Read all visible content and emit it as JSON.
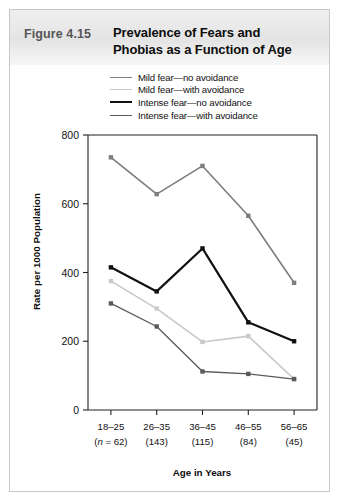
{
  "figure": {
    "number_label": "Figure 4.15",
    "title_line1": "Prevalence of Fears and",
    "title_line2": "Phobias as a Function of Age"
  },
  "legend": {
    "position": "top",
    "items": [
      {
        "label": "Mild fear—no avoidance",
        "color": "#7d7d7d",
        "width": 1.6
      },
      {
        "label": "Mild fear—with avoidance",
        "color": "#c9c9c9",
        "width": 1.6
      },
      {
        "label": "Intense fear—no avoidance",
        "color": "#111111",
        "width": 2.2
      },
      {
        "label": "Intense fear—with avoidance",
        "color": "#5a5a5a",
        "width": 1.3
      }
    ]
  },
  "axes": {
    "ylabel": "Rate per 1000 Population",
    "xlabel": "Age in Years",
    "yticks": [
      "800",
      "600",
      "400",
      "200",
      "0"
    ],
    "ylim_min": 0,
    "ylim_max": 800,
    "grid": false,
    "xtick_labels": [
      "18–25",
      "26–35",
      "36–45",
      "46–55",
      "56–65"
    ],
    "xtick_sublabels": [
      "(n = 62)",
      "(143)",
      "(115)",
      "(84)",
      "(45)"
    ],
    "xtick_sub_italic_first": "n"
  },
  "chart_data": {
    "type": "line",
    "title": "Prevalence of Fears and Phobias as a Function of Age",
    "xlabel": "Age in Years",
    "ylabel": "Rate per 1000 Population",
    "ylim": [
      0,
      800
    ],
    "grid": false,
    "legend_position": "top",
    "categories": [
      "18–25",
      "26–35",
      "36–45",
      "46–55",
      "56–65"
    ],
    "sample_sizes": [
      62,
      143,
      115,
      84,
      45
    ],
    "series": [
      {
        "name": "Mild fear—no avoidance",
        "color": "#7d7d7d",
        "values": [
          735,
          628,
          710,
          565,
          370
        ]
      },
      {
        "name": "Mild fear—with avoidance",
        "color": "#c9c9c9",
        "values": [
          375,
          295,
          198,
          215,
          90
        ]
      },
      {
        "name": "Intense fear—no avoidance",
        "color": "#111111",
        "values": [
          415,
          345,
          470,
          255,
          200
        ]
      },
      {
        "name": "Intense fear—with avoidance",
        "color": "#5a5a5a",
        "values": [
          310,
          243,
          112,
          105,
          90
        ]
      }
    ]
  },
  "colors": {
    "frame": "#c8c8c8",
    "header_band": "#e9e9e9",
    "axis": "#222222",
    "background": "#ffffff"
  }
}
